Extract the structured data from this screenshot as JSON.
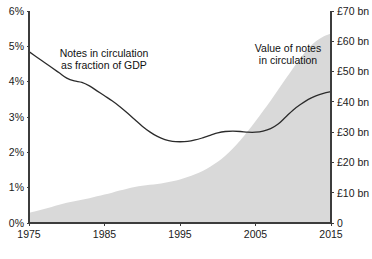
{
  "chart_data": {
    "type": "area",
    "title": "",
    "subtitle": "",
    "xlabel": "",
    "grid": false,
    "legend_position": "inline-annotations",
    "x": [
      1975,
      1976,
      1977,
      1978,
      1979,
      1980,
      1981,
      1982,
      1983,
      1984,
      1985,
      1986,
      1987,
      1988,
      1989,
      1990,
      1991,
      1992,
      1993,
      1994,
      1995,
      1996,
      1997,
      1998,
      1999,
      2000,
      2001,
      2002,
      2003,
      2004,
      2005,
      2006,
      2007,
      2008,
      2009,
      2010,
      2011,
      2012,
      2013,
      2014,
      2015
    ],
    "x_tick_labels": [
      "1975",
      "1985",
      "1995",
      "2005",
      "2015"
    ],
    "x_ticks": [
      1975,
      1985,
      1995,
      2005,
      2015
    ],
    "xlim": [
      1975,
      2015
    ],
    "axes": [
      {
        "id": "left",
        "ylabel": "",
        "ylim": [
          0,
          6
        ],
        "ticks": [
          0,
          1,
          2,
          3,
          4,
          5,
          6
        ],
        "tick_labels": [
          "0%",
          "1%",
          "2%",
          "3%",
          "4%",
          "5%",
          "6%"
        ]
      },
      {
        "id": "right",
        "ylabel": "",
        "ylim": [
          0,
          70
        ],
        "ticks": [
          0,
          10,
          20,
          30,
          40,
          50,
          60,
          70
        ],
        "tick_labels": [
          "0",
          "£10 bn",
          "£20 bn",
          "£30 bn",
          "£40 bn",
          "£50 bn",
          "£60 bn",
          "£70 bn"
        ]
      }
    ],
    "series": [
      {
        "name": "Notes in circulation as fraction of GDP",
        "type": "line",
        "axis": "left",
        "unit": "percent of GDP",
        "color": "#2b2b2b",
        "values": [
          4.85,
          4.7,
          4.55,
          4.4,
          4.25,
          4.1,
          4.02,
          3.98,
          3.88,
          3.74,
          3.6,
          3.46,
          3.3,
          3.12,
          2.93,
          2.74,
          2.58,
          2.45,
          2.36,
          2.31,
          2.3,
          2.31,
          2.35,
          2.41,
          2.48,
          2.55,
          2.59,
          2.6,
          2.59,
          2.57,
          2.57,
          2.6,
          2.67,
          2.8,
          3.0,
          3.2,
          3.36,
          3.5,
          3.6,
          3.67,
          3.72
        ]
      },
      {
        "name": "Value of notes in circulation",
        "type": "area",
        "axis": "right",
        "unit": "£ billions",
        "color": "#d9d9d9",
        "values": [
          3.4,
          4.0,
          4.6,
          5.3,
          6.0,
          6.7,
          7.2,
          7.7,
          8.2,
          8.8,
          9.4,
          10.0,
          10.7,
          11.3,
          11.9,
          12.3,
          12.6,
          12.9,
          13.3,
          13.8,
          14.4,
          15.2,
          16.1,
          17.2,
          18.6,
          20.2,
          22.2,
          24.6,
          27.3,
          30.4,
          33.6,
          37.0,
          40.4,
          44.0,
          47.6,
          51.2,
          54.6,
          57.6,
          60.0,
          61.6,
          62.6
        ]
      }
    ],
    "annotations": [
      {
        "id": "annotation-gdp-share",
        "lines": [
          "Notes in circulation",
          "as fraction of GDP"
        ],
        "x_px": 104,
        "y_px": 57
      },
      {
        "id": "annotation-note-value",
        "lines": [
          "Value of notes",
          "in circulation"
        ],
        "x_px": 288,
        "y_px": 52
      }
    ]
  },
  "plot_geometry": {
    "left_px": 29,
    "right_px": 331,
    "top_px": 11,
    "bottom_px": 223
  }
}
